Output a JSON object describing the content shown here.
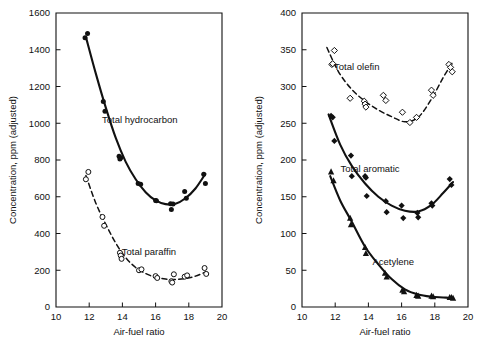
{
  "figure": {
    "title": "",
    "panels": [
      "left",
      "right"
    ]
  },
  "chart_data": [
    {
      "panel": "left",
      "type": "scatter",
      "title": "",
      "xlabel": "Air-fuel ratio",
      "ylabel": "Concentration, ppm (adjusted)",
      "xlim": [
        10,
        20
      ],
      "ylim": [
        0,
        1600
      ],
      "xticks": [
        10,
        12,
        14,
        16,
        18,
        20
      ],
      "xticklabels": [
        "10",
        "12",
        "14",
        "16",
        "18",
        "20"
      ],
      "yticks": [
        0,
        200,
        400,
        600,
        800,
        1000,
        1200,
        1400,
        1600
      ],
      "yticklabels": [
        "0",
        "200",
        "400",
        "600",
        "800",
        "1000",
        "1200",
        "1400",
        "1600"
      ],
      "grid": false,
      "legend_position": "inline-annotation",
      "series": [
        {
          "name": "Total hydrocarbon",
          "marker": "filled-circle",
          "line": "solid",
          "label_x": 15.05,
          "label_y": 1000,
          "x": [
            11.75,
            11.9,
            12.85,
            12.95,
            13.8,
            13.85,
            13.9,
            14.95,
            15.1,
            16.0,
            16.05,
            16.9,
            16.95,
            17.05,
            17.75,
            17.85,
            18.9,
            19.0
          ],
          "y": [
            1465,
            1488,
            1118,
            1065,
            820,
            805,
            812,
            672,
            668,
            580,
            578,
            562,
            530,
            560,
            628,
            592,
            722,
            672
          ],
          "fit_x": [
            11.8,
            12.4,
            13.0,
            13.6,
            14.2,
            14.8,
            15.4,
            16.0,
            16.6,
            17.2,
            17.8,
            18.4,
            19.0
          ],
          "fit_y": [
            1470,
            1270,
            1085,
            920,
            790,
            695,
            625,
            580,
            560,
            562,
            592,
            645,
            725
          ]
        },
        {
          "name": "Total paraffin",
          "marker": "open-circle",
          "line": "dashed",
          "label_x": 15.6,
          "label_y": 282,
          "x": [
            11.8,
            11.95,
            12.8,
            12.9,
            13.85,
            13.9,
            13.95,
            15.0,
            15.15,
            16.0,
            16.1,
            16.95,
            17.0,
            17.1,
            17.75,
            17.9,
            18.95,
            19.05
          ],
          "y": [
            695,
            735,
            490,
            442,
            295,
            280,
            262,
            200,
            205,
            168,
            158,
            140,
            133,
            178,
            165,
            172,
            212,
            180
          ],
          "fit_x": [
            11.8,
            12.4,
            13.0,
            13.6,
            14.2,
            14.8,
            15.4,
            16.0,
            16.6,
            17.2,
            17.8,
            18.4,
            19.0
          ],
          "fit_y": [
            715,
            565,
            450,
            348,
            268,
            215,
            182,
            162,
            152,
            150,
            155,
            168,
            190
          ]
        }
      ]
    },
    {
      "panel": "right",
      "type": "scatter",
      "title": "",
      "xlabel": "Air-fuel ratio",
      "ylabel": "Concentration, ppm (adjusted)",
      "xlim": [
        10,
        20
      ],
      "ylim": [
        0,
        400
      ],
      "xticks": [
        10,
        12,
        14,
        16,
        18,
        20
      ],
      "xticklabels": [
        "10",
        "12",
        "14",
        "16",
        "18",
        "20"
      ],
      "yticks": [
        0,
        50,
        100,
        150,
        200,
        250,
        300,
        350,
        400
      ],
      "yticklabels": [
        "0",
        "50",
        "100",
        "150",
        "200",
        "250",
        "300",
        "350",
        "400"
      ],
      "grid": false,
      "legend_position": "inline-annotation",
      "series": [
        {
          "name": "Total olefin",
          "marker": "open-diamond",
          "line": "dashed",
          "label_x": 13.3,
          "label_y": 322,
          "x": [
            11.8,
            11.95,
            11.85,
            12.9,
            13.75,
            13.8,
            13.85,
            14.9,
            15.05,
            16.05,
            16.5,
            16.9,
            17.8,
            17.9,
            18.85,
            18.95,
            19.05
          ],
          "y": [
            330,
            349,
            331,
            284,
            280,
            276,
            272,
            288,
            281,
            265,
            251,
            258,
            295,
            288,
            330,
            326,
            320
          ],
          "fit_x": [
            11.5,
            12.2,
            13.0,
            13.8,
            14.6,
            15.4,
            16.2,
            17.0,
            17.8,
            18.5,
            19.1
          ],
          "fit_y": [
            353,
            320,
            296,
            280,
            268,
            259,
            252,
            258,
            283,
            312,
            334
          ]
        },
        {
          "name": "Total aromatic",
          "marker": "filled-diamond",
          "line": "solid",
          "label_x": 14.1,
          "label_y": 183,
          "x": [
            11.75,
            11.85,
            11.95,
            12.95,
            13.0,
            13.8,
            13.85,
            13.9,
            15.05,
            15.1,
            16.0,
            16.1,
            16.95,
            17.0,
            17.8,
            17.85,
            18.9,
            19.0
          ],
          "y": [
            260,
            258,
            226,
            206,
            178,
            178,
            176,
            151,
            144,
            129,
            138,
            121,
            128,
            122,
            141,
            138,
            174,
            166
          ],
          "fit_x": [
            11.6,
            12.3,
            13.0,
            13.8,
            14.6,
            15.4,
            16.2,
            17.0,
            17.8,
            18.5,
            19.1
          ],
          "fit_y": [
            262,
            221,
            192,
            168,
            150,
            138,
            131,
            130,
            139,
            155,
            170
          ]
        },
        {
          "name": "Acetylene",
          "marker": "filled-triangle",
          "line": "solid",
          "label_x": 15.5,
          "label_y": 57,
          "x": [
            11.75,
            11.9,
            12.9,
            12.95,
            13.8,
            13.85,
            15.0,
            15.1,
            16.05,
            16.15,
            16.9,
            17.0,
            17.8,
            17.9,
            18.9,
            19.0,
            19.1
          ],
          "y": [
            184,
            172,
            121,
            112,
            81,
            73,
            46,
            41,
            23,
            21,
            16,
            15,
            15,
            14,
            13,
            13,
            12
          ],
          "fit_x": [
            11.7,
            12.3,
            13.0,
            13.8,
            14.6,
            15.4,
            16.2,
            17.0,
            17.8,
            18.5,
            19.1
          ],
          "fit_y": [
            178,
            145,
            116,
            82,
            58,
            38,
            24,
            17,
            14,
            13,
            12
          ]
        }
      ]
    }
  ]
}
